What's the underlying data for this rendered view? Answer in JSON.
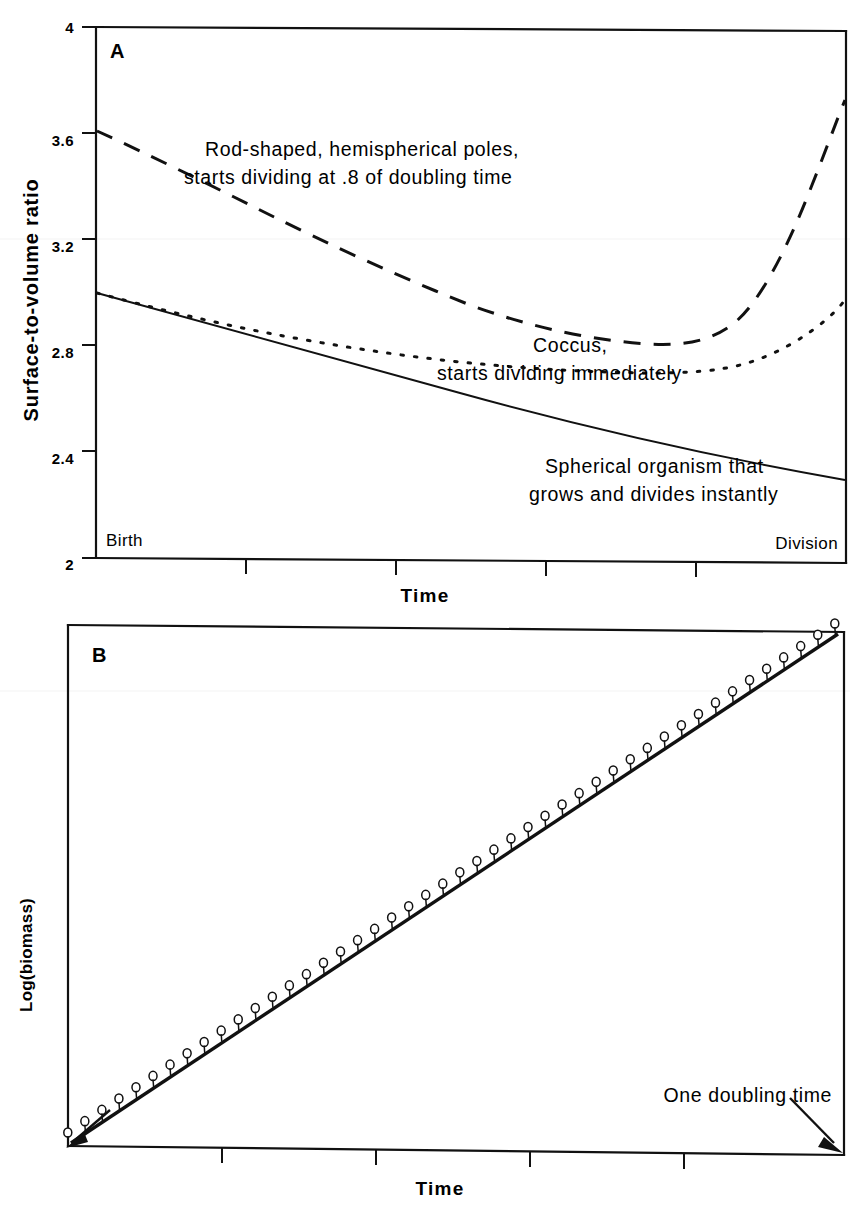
{
  "figure": {
    "title": "",
    "panels": [
      "A",
      "B"
    ]
  },
  "panelA": {
    "letter": "A",
    "ylabel": "Surface-to-volume  ratio",
    "xlabel": "Time",
    "y_ticks": [
      "4",
      "3.6",
      "3.2",
      "2.8",
      "2.4",
      "2"
    ],
    "x_start_label": "Birth",
    "x_end_label": "Division",
    "annotations": [
      {
        "name": "rod-shaped-annotation",
        "line1": "Rod-shaped, hemispherical poles,",
        "line2": "starts dividing at .8 of doubling time"
      },
      {
        "name": "coccus-annotation",
        "line1": "Coccus,",
        "line2": "starts dividing immediately"
      },
      {
        "name": "spherical-annotation",
        "line1": "Spherical organism that",
        "line2": "grows and divides instantly"
      }
    ]
  },
  "panelB": {
    "letter": "B",
    "ylabel": "Log(biomass)",
    "xlabel": "Time",
    "annotation": "One doubling time"
  },
  "chart_data": [
    {
      "type": "line",
      "id": "panel-A",
      "title": "A",
      "xlabel": "Time",
      "ylabel": "Surface-to-volume ratio",
      "ylim": [
        2,
        4
      ],
      "ytick_values": [
        2,
        2.4,
        2.8,
        3.2,
        3.6,
        4
      ],
      "xlim": [
        0,
        1
      ],
      "xtick_values": [
        0.2,
        0.4,
        0.6,
        0.8
      ],
      "x_axis_endpoints": [
        "Birth",
        "Division"
      ],
      "grid": false,
      "legend": "inline-annotations",
      "series": [
        {
          "name": "Rod-shaped, hemispherical poles, starts dividing at .8 of doubling time",
          "style": "dashed",
          "x": [
            0.0,
            0.05,
            0.1,
            0.15,
            0.2,
            0.25,
            0.3,
            0.35,
            0.4,
            0.45,
            0.5,
            0.55,
            0.6,
            0.65,
            0.7,
            0.75,
            0.8,
            0.85,
            0.9,
            0.95,
            1.0
          ],
          "y": [
            3.63,
            3.55,
            3.47,
            3.4,
            3.33,
            3.26,
            3.2,
            3.14,
            3.09,
            3.04,
            3.0,
            2.96,
            2.93,
            2.91,
            2.9,
            2.9,
            2.93,
            3.02,
            3.2,
            3.5,
            3.9
          ]
        },
        {
          "name": "Coccus, starts dividing immediately",
          "style": "dotted",
          "x": [
            0.0,
            0.05,
            0.1,
            0.15,
            0.2,
            0.25,
            0.3,
            0.35,
            0.4,
            0.45,
            0.5,
            0.55,
            0.6,
            0.65,
            0.7,
            0.75,
            0.8,
            0.85,
            0.9,
            0.95,
            1.0
          ],
          "y": [
            3.02,
            2.97,
            2.93,
            2.89,
            2.85,
            2.82,
            2.79,
            2.76,
            2.74,
            2.72,
            2.7,
            2.69,
            2.68,
            2.67,
            2.67,
            2.67,
            2.68,
            2.71,
            2.76,
            2.83,
            2.92
          ]
        },
        {
          "name": "Spherical organism that grows and divides instantly",
          "style": "solid",
          "x": [
            0.0,
            0.1,
            0.2,
            0.3,
            0.4,
            0.5,
            0.6,
            0.7,
            0.8,
            0.9,
            1.0
          ],
          "y": [
            3.02,
            2.95,
            2.88,
            2.81,
            2.74,
            2.67,
            2.6,
            2.53,
            2.47,
            2.42,
            2.37
          ]
        }
      ]
    },
    {
      "type": "line",
      "id": "panel-B",
      "title": "B",
      "xlabel": "Time",
      "ylabel": "Log(biomass)",
      "grid": false,
      "xtick_count": 4,
      "annotation": "One doubling time",
      "series": [
        {
          "name": "exponential growth (log-linear)",
          "style": "solid",
          "x": [
            0,
            1
          ],
          "y": [
            0,
            1
          ]
        },
        {
          "name": "discrete cell-cycle markers",
          "style": "capsule-markers",
          "marker_count": 46,
          "description": "small capsule symbols stepping above the straight log-linear growth line"
        }
      ]
    }
  ]
}
